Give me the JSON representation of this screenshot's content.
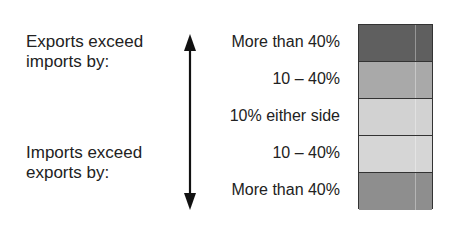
{
  "side_labels": {
    "exports": [
      "Exports exceed",
      "imports by:"
    ],
    "imports": [
      "Imports exceed",
      "exports by:"
    ]
  },
  "categories": [
    {
      "label": "More than 40%",
      "color": "#5f5f5f"
    },
    {
      "label": "10 – 40%",
      "color": "#a9a9a9"
    },
    {
      "label": "10% either side",
      "color": "#d2d2d2"
    },
    {
      "label": "10 – 40%",
      "color": "#d6d6d6"
    },
    {
      "label": "More than 40%",
      "color": "#8e8e8e"
    }
  ]
}
